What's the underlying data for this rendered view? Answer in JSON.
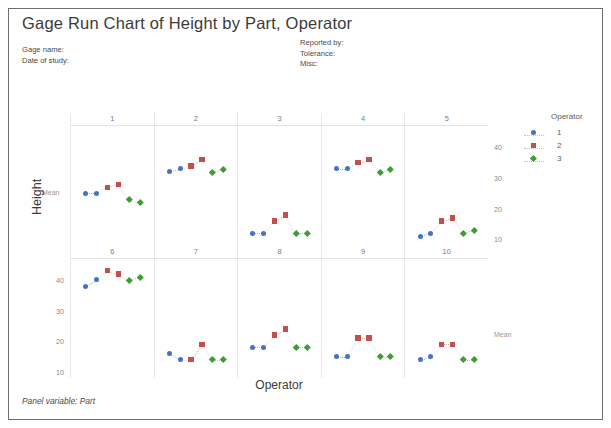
{
  "window": {
    "title": "Gage Run Chart of Height by Part, Operator"
  },
  "header": {
    "gage_name_label": "Gage name:",
    "date_of_study_label": "Date of study:",
    "reported_by_label": "Reported by:",
    "tolerance_label": "Tolerance:",
    "misc_label": "Misc:"
  },
  "legend": {
    "title": "Operator",
    "entries": [
      {
        "label": "1",
        "color": "#4472c4",
        "marker": "circle"
      },
      {
        "label": "2",
        "color": "#c0504d",
        "marker": "square"
      },
      {
        "label": "3",
        "color": "#3f9c35",
        "marker": "diamond"
      }
    ]
  },
  "axes": {
    "y_title": "Height",
    "x_title": "Operator",
    "mean_label": "Mean",
    "y_ticks_bottom_left": [
      "40",
      "30",
      "20",
      "10"
    ],
    "y_ticks_top_right": [
      "40",
      "30",
      "20",
      "10"
    ]
  },
  "footer": {
    "panel_variable": "Panel variable: Part"
  },
  "chart_data": {
    "type": "scatter",
    "title": "Gage Run Chart of Height by Part, Operator",
    "xlabel": "Operator",
    "ylabel": "Height",
    "ylim": [
      8,
      47
    ],
    "grid": false,
    "legend_position": "right",
    "panel_variable": "Part",
    "panel_layout": {
      "rows": 2,
      "cols": 5
    },
    "series_names": [
      "1",
      "2",
      "3"
    ],
    "series_colors": [
      "#4472c4",
      "#c0504d",
      "#3f9c35"
    ],
    "runs_per_operator": 2,
    "panels": [
      {
        "part": "1",
        "row": 0,
        "col": 0,
        "series": [
          {
            "name": "1",
            "values": [
              25,
              25
            ]
          },
          {
            "name": "2",
            "values": [
              27,
              28
            ]
          },
          {
            "name": "3",
            "values": [
              23,
              22
            ]
          }
        ],
        "mean": 25
      },
      {
        "part": "2",
        "row": 0,
        "col": 1,
        "series": [
          {
            "name": "1",
            "values": [
              32,
              33
            ]
          },
          {
            "name": "2",
            "values": [
              34,
              36
            ]
          },
          {
            "name": "3",
            "values": [
              32,
              33
            ]
          }
        ],
        "mean": 33.3
      },
      {
        "part": "3",
        "row": 0,
        "col": 2,
        "series": [
          {
            "name": "1",
            "values": [
              12,
              12
            ]
          },
          {
            "name": "2",
            "values": [
              16,
              18
            ]
          },
          {
            "name": "3",
            "values": [
              12,
              12
            ]
          }
        ],
        "mean": 13.7
      },
      {
        "part": "4",
        "row": 0,
        "col": 3,
        "series": [
          {
            "name": "1",
            "values": [
              33,
              33
            ]
          },
          {
            "name": "2",
            "values": [
              35,
              36
            ]
          },
          {
            "name": "3",
            "values": [
              32,
              33
            ]
          }
        ],
        "mean": 33.7
      },
      {
        "part": "5",
        "row": 0,
        "col": 4,
        "series": [
          {
            "name": "1",
            "values": [
              11,
              12
            ]
          },
          {
            "name": "2",
            "values": [
              16,
              17
            ]
          },
          {
            "name": "3",
            "values": [
              12,
              13
            ]
          }
        ],
        "mean": 13.5
      },
      {
        "part": "6",
        "row": 1,
        "col": 0,
        "series": [
          {
            "name": "1",
            "values": [
              38,
              40
            ]
          },
          {
            "name": "2",
            "values": [
              43,
              42
            ]
          },
          {
            "name": "3",
            "values": [
              40,
              41
            ]
          }
        ],
        "mean": 40.7
      },
      {
        "part": "7",
        "row": 1,
        "col": 1,
        "series": [
          {
            "name": "1",
            "values": [
              16,
              14
            ]
          },
          {
            "name": "2",
            "values": [
              14,
              19
            ]
          },
          {
            "name": "3",
            "values": [
              14,
              14
            ]
          }
        ],
        "mean": 15.2
      },
      {
        "part": "8",
        "row": 1,
        "col": 2,
        "series": [
          {
            "name": "1",
            "values": [
              18,
              18
            ]
          },
          {
            "name": "2",
            "values": [
              22,
              24
            ]
          },
          {
            "name": "3",
            "values": [
              18,
              18
            ]
          }
        ],
        "mean": 19.7
      },
      {
        "part": "9",
        "row": 1,
        "col": 3,
        "series": [
          {
            "name": "1",
            "values": [
              15,
              15
            ]
          },
          {
            "name": "2",
            "values": [
              21,
              21
            ]
          },
          {
            "name": "3",
            "values": [
              15,
              15
            ]
          }
        ],
        "mean": 17
      },
      {
        "part": "10",
        "row": 1,
        "col": 4,
        "series": [
          {
            "name": "1",
            "values": [
              14,
              15
            ]
          },
          {
            "name": "2",
            "values": [
              19,
              19
            ]
          },
          {
            "name": "3",
            "values": [
              14,
              14
            ]
          }
        ],
        "mean": 15.8
      }
    ]
  }
}
